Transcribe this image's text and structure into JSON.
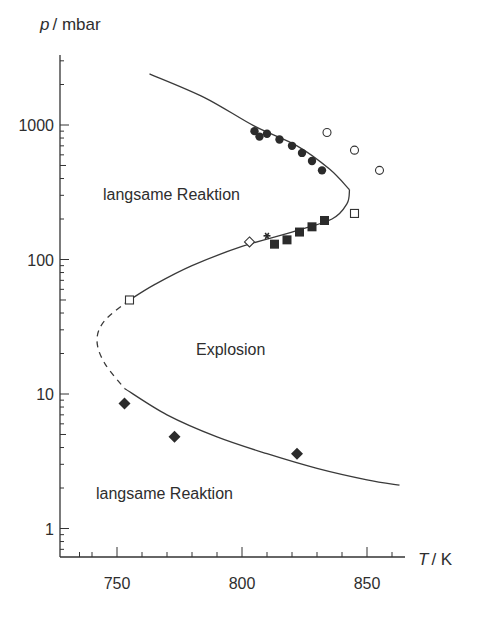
{
  "chart_data": {
    "type": "scatter",
    "title": "",
    "xlabel": "T / K",
    "ylabel": "p / mbar",
    "xlabel_italic_part": "T",
    "xlabel_unit": "/ K",
    "ylabel_italic_part": "p",
    "ylabel_unit": "/ mbar",
    "x_scale": "linear",
    "y_scale": "log",
    "xlim": [
      730,
      865
    ],
    "ylim": [
      0.8,
      3000
    ],
    "x_ticks": [
      750,
      800,
      850
    ],
    "x_tick_labels": [
      "750",
      "800",
      "850"
    ],
    "y_ticks": [
      1,
      10,
      100,
      1000
    ],
    "y_tick_labels": [
      "1",
      "10",
      "100",
      "1000"
    ],
    "grid": false,
    "legend": "none",
    "annotations": [
      {
        "text": "langsame Reaktion",
        "x": 785,
        "y": 400
      },
      {
        "text": "Explosion",
        "x": 805,
        "y": 22
      },
      {
        "text": "langsame Reaktion",
        "x": 783,
        "y": 1.7
      }
    ],
    "curves": [
      {
        "name": "third explosion limit (upper branch)",
        "style": "solid",
        "points": [
          [
            763,
            2400
          ],
          [
            785,
            1600
          ],
          [
            805,
            980
          ],
          [
            822,
            700
          ],
          [
            835,
            470
          ],
          [
            843,
            330
          ]
        ]
      },
      {
        "name": "second explosion limit (nose)",
        "style": "solid",
        "points": [
          [
            843,
            330
          ],
          [
            842,
            260
          ],
          [
            836,
            200
          ],
          [
            820,
            160
          ],
          [
            800,
            125
          ],
          [
            780,
            90
          ],
          [
            765,
            65
          ],
          [
            755,
            50
          ]
        ]
      },
      {
        "name": "extrapolated limit",
        "style": "dashed",
        "points": [
          [
            755,
            50
          ],
          [
            745,
            35
          ],
          [
            742,
            25
          ],
          [
            745,
            17
          ],
          [
            753,
            11
          ]
        ]
      },
      {
        "name": "first explosion limit",
        "style": "solid",
        "points": [
          [
            753,
            11
          ],
          [
            770,
            7
          ],
          [
            790,
            4.8
          ],
          [
            810,
            3.6
          ],
          [
            830,
            2.8
          ],
          [
            850,
            2.3
          ],
          [
            863,
            2.1
          ]
        ]
      }
    ],
    "series": [
      {
        "name": "filled circles",
        "marker": "circle-filled",
        "points": [
          [
            805,
            900
          ],
          [
            807,
            820
          ],
          [
            810,
            860
          ],
          [
            815,
            780
          ],
          [
            820,
            700
          ],
          [
            824,
            620
          ],
          [
            828,
            540
          ],
          [
            832,
            460
          ]
        ]
      },
      {
        "name": "open circles",
        "marker": "circle-open",
        "points": [
          [
            834,
            880
          ],
          [
            845,
            650
          ],
          [
            855,
            460
          ]
        ]
      },
      {
        "name": "filled squares",
        "marker": "square-filled",
        "points": [
          [
            813,
            130
          ],
          [
            818,
            140
          ],
          [
            823,
            160
          ],
          [
            828,
            175
          ],
          [
            833,
            195
          ]
        ]
      },
      {
        "name": "open squares",
        "marker": "square-open",
        "points": [
          [
            755,
            50
          ],
          [
            845,
            220
          ]
        ]
      },
      {
        "name": "open diamond",
        "marker": "diamond-open",
        "points": [
          [
            803,
            135
          ]
        ]
      },
      {
        "name": "asterisk",
        "marker": "asterisk",
        "points": [
          [
            810,
            150
          ]
        ]
      },
      {
        "name": "filled diamonds",
        "marker": "diamond-filled",
        "points": [
          [
            753,
            8.5
          ],
          [
            773,
            4.8
          ],
          [
            822,
            3.6
          ]
        ]
      }
    ]
  }
}
